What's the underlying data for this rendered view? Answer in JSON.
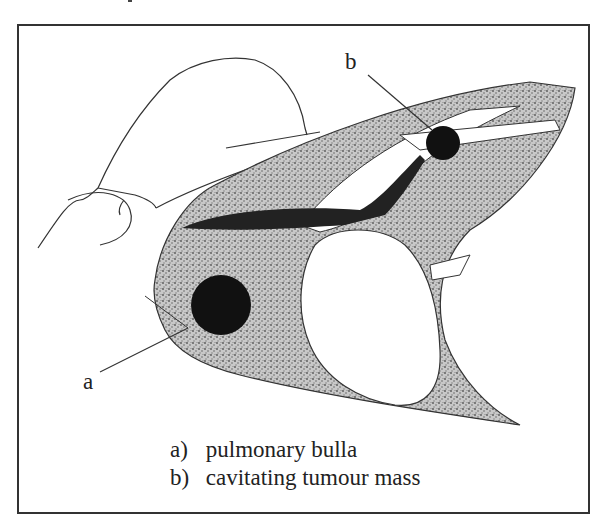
{
  "figure": {
    "type": "anatomical-diagram",
    "callouts": [
      {
        "id": "a",
        "label": "a",
        "target": "pulmonary-bulla"
      },
      {
        "id": "b",
        "label": "b",
        "target": "cavitating-tumour-mass"
      }
    ]
  },
  "legend": {
    "items": [
      {
        "key": "a)",
        "text": "pulmonary bulla"
      },
      {
        "key": "b)",
        "text": "cavitating tumour mass"
      }
    ]
  },
  "colors": {
    "stipple": "#8a8a8a",
    "lesion": "#111111",
    "outline": "#333333",
    "frame": "#333333",
    "background": "#ffffff"
  }
}
